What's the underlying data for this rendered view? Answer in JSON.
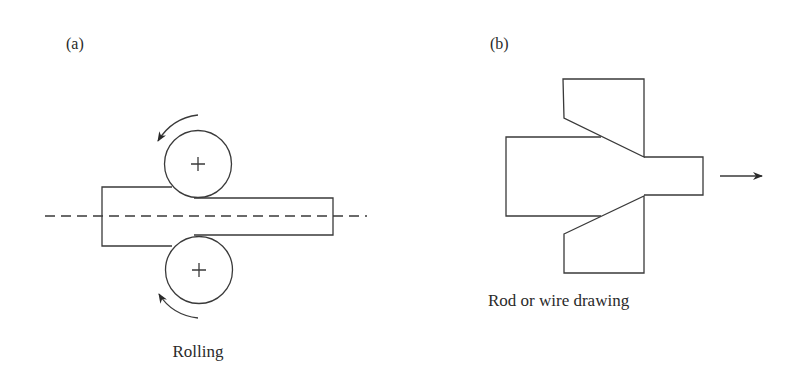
{
  "panels": [
    {
      "id": "a",
      "label": "(a)",
      "caption": "Rolling",
      "elements": {
        "workpiece": "slab reduced in thickness between two rolls",
        "rolls": [
          {
            "position": "top",
            "marker": "+",
            "rotation": "counterclockwise"
          },
          {
            "position": "bottom",
            "marker": "+",
            "rotation": "clockwise"
          }
        ],
        "centerline": "dashed horizontal axis of symmetry"
      }
    },
    {
      "id": "b",
      "label": "(b)",
      "caption": "Rod or wire drawing",
      "elements": {
        "workpiece": "rod pulled through a converging die",
        "die": "two die halves with tapered entry",
        "pull_direction": "right"
      }
    }
  ],
  "colors": {
    "line": "#3a3a3a",
    "text": "#2a2a2a",
    "background": "#ffffff"
  }
}
